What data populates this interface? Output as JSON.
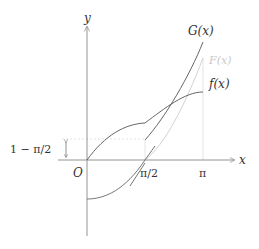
{
  "diagram": {
    "type": "function-graph",
    "axes": {
      "x_label": "x",
      "y_label": "y",
      "origin_label": "O"
    },
    "x_ticks": [
      "π/2",
      "π"
    ],
    "y_annotation": "1 − π/2",
    "curves": [
      {
        "name": "f(x)",
        "label": "f(x)",
        "color": "#555555"
      },
      {
        "name": "G(x)",
        "label": "G(x)",
        "color": "#555555"
      },
      {
        "name": "F(x)",
        "label": "F(x)",
        "color": "#c8c8c8"
      }
    ],
    "colors": {
      "axis": "#888888",
      "curve": "#555555",
      "light_curve": "#c8c8c8",
      "guide": "#dddddd"
    }
  }
}
